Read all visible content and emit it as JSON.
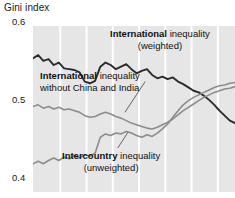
{
  "chart_data": {
    "type": "line",
    "title": "Gini index",
    "xlabel": "",
    "ylabel": "Gini index",
    "ylim": [
      0.4,
      0.6
    ],
    "yticks": [
      0.6,
      0.5,
      0.4
    ],
    "ytick_labels": [
      "0.6",
      "0.5",
      "0.4"
    ],
    "grid": "vertical-only",
    "legend_position": "inline-annotations",
    "x": [
      0,
      1,
      2,
      3,
      4,
      5,
      6,
      7,
      8,
      9,
      10,
      11,
      12,
      13,
      14,
      15,
      16,
      17,
      18,
      19,
      20,
      21,
      22,
      23,
      24,
      25,
      26,
      27,
      28,
      29,
      30,
      31,
      32,
      33,
      34,
      35,
      36,
      37,
      38,
      39
    ],
    "series": [
      {
        "name": "International inequality (weighted)",
        "color": "#2b2b2b",
        "width": 1.9,
        "values": [
          0.561,
          0.565,
          0.558,
          0.56,
          0.553,
          0.556,
          0.549,
          0.548,
          0.547,
          0.544,
          0.533,
          0.531,
          0.534,
          0.551,
          0.556,
          0.553,
          0.548,
          0.551,
          0.554,
          0.548,
          0.543,
          0.546,
          0.548,
          0.541,
          0.537,
          0.539,
          0.536,
          0.538,
          0.533,
          0.53,
          0.526,
          0.522,
          0.52,
          0.516,
          0.511,
          0.505,
          0.498,
          0.492,
          0.486,
          0.483
        ]
      },
      {
        "name": "International inequality without China and India",
        "color": "#8c8c8c",
        "width": 1.6,
        "values": [
          0.503,
          0.505,
          0.501,
          0.503,
          0.5,
          0.502,
          0.499,
          0.5,
          0.498,
          0.496,
          0.492,
          0.49,
          0.491,
          0.494,
          0.496,
          0.494,
          0.491,
          0.489,
          0.486,
          0.483,
          0.481,
          0.479,
          0.477,
          0.476,
          0.478,
          0.481,
          0.484,
          0.488,
          0.493,
          0.498,
          0.502,
          0.506,
          0.51,
          0.514,
          0.517,
          0.52,
          0.522,
          0.524,
          0.525,
          0.527
        ]
      },
      {
        "name": "Intercountry inequality (unweighted)",
        "color": "#8c8c8c",
        "width": 1.6,
        "values": [
          0.434,
          0.437,
          0.434,
          0.438,
          0.441,
          0.438,
          0.442,
          0.44,
          0.444,
          0.441,
          0.445,
          0.443,
          0.447,
          0.466,
          0.47,
          0.468,
          0.471,
          0.47,
          0.473,
          0.471,
          0.468,
          0.466,
          0.469,
          0.467,
          0.471,
          0.476,
          0.482,
          0.49,
          0.498,
          0.505,
          0.51,
          0.514,
          0.517,
          0.52,
          0.523,
          0.526,
          0.528,
          0.529,
          0.531,
          0.532
        ]
      }
    ],
    "gridlines_x": [
      0.135,
      0.265,
      0.395,
      0.525,
      0.655,
      0.785,
      0.915
    ],
    "annotations": [
      {
        "id": "weighted",
        "bold": "International",
        "rest": " inequality",
        "line2": "(weighted)",
        "leader_from": [
          0.555,
          0.335
        ],
        "leader_to": [
          0.455,
          0.52
        ]
      },
      {
        "id": "nochina",
        "bold": "International",
        "rest": " inequality",
        "line2": "without China and India",
        "leader_from": null,
        "leader_to": null
      },
      {
        "id": "unweighted",
        "bold": "Intercountry",
        "rest": " inequality",
        "line2": "(unweighted)",
        "leader_from": [
          0.42,
          0.735
        ],
        "leader_to": [
          0.47,
          0.64
        ]
      }
    ]
  }
}
